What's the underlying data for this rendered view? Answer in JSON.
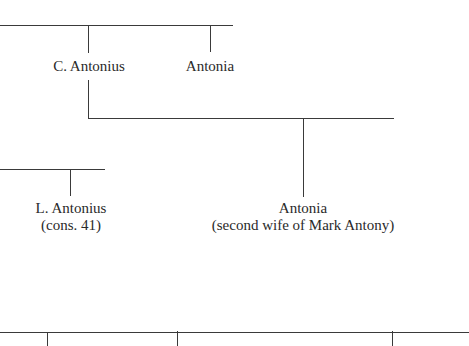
{
  "diagram": {
    "type": "family-tree",
    "colors": {
      "line": "#3a3a3a",
      "text": "#2a2a2a",
      "background": "#ffffff"
    },
    "nodes": [
      {
        "id": "c-antonius",
        "name": "C. Antonius",
        "note": ""
      },
      {
        "id": "antonia-1",
        "name": "Antonia",
        "note": ""
      },
      {
        "id": "l-antonius",
        "name": "L. Antonius",
        "note": "(cons. 41)"
      },
      {
        "id": "antonia-2",
        "name": "Antonia",
        "note": "(second wife of Mark Antony)"
      }
    ],
    "edges": [
      {
        "from": "sibling-line-top",
        "to": "c-antonius"
      },
      {
        "from": "sibling-line-top",
        "to": "antonia-1"
      },
      {
        "from": "c-antonius",
        "to": "antonia-2"
      },
      {
        "from": "sibling-line-left",
        "to": "l-antonius"
      }
    ]
  }
}
